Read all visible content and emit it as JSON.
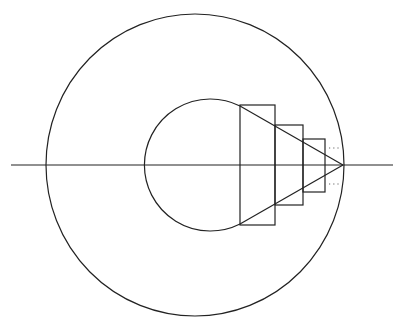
{
  "diagram": {
    "type": "geometric-construction",
    "stroke_color": "#222222",
    "background": "#ffffff",
    "axis": {
      "x1": 11,
      "y1": 165,
      "x2": 393,
      "y2": 165
    },
    "outer_circle": {
      "cx": 195,
      "cy": 165,
      "rx": 149,
      "ry": 151
    },
    "inner_circle": {
      "cx": 210,
      "cy": 165,
      "r": 66
    },
    "rectangles": [
      {
        "x": 240,
        "y": 105,
        "w": 35,
        "h": 120
      },
      {
        "x": 275,
        "y": 125,
        "w": 28,
        "h": 80
      },
      {
        "x": 303,
        "y": 139,
        "w": 22,
        "h": 53
      }
    ],
    "apex": {
      "x": 343,
      "y": 165
    },
    "tangent_points": [
      {
        "x": 240,
        "y": 105
      },
      {
        "x": 240,
        "y": 225
      }
    ],
    "ellipsis_marks": [
      {
        "x": 329,
        "y": 148,
        "text": "..."
      },
      {
        "x": 329,
        "y": 184,
        "text": "..."
      }
    ]
  }
}
